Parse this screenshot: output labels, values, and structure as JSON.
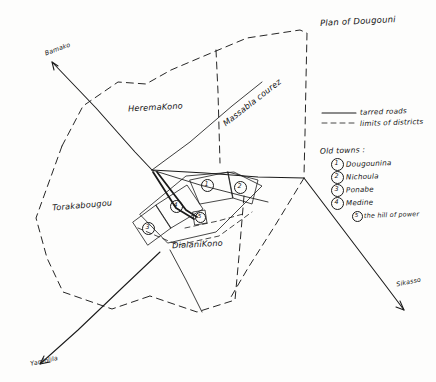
{
  "document": {
    "title": "Plan of Dougouni",
    "type": "hand-drawn map sketch",
    "background_color": "#fdfdfc",
    "ink_color": "#1a1a1a"
  },
  "districts": [
    {
      "id": "heremakono",
      "label": "HeremaKono",
      "x": 128,
      "y": 102,
      "rotate": -3
    },
    {
      "id": "massablacourez",
      "label": "Massabla courez",
      "x": 227,
      "y": 118,
      "rotate": -38
    },
    {
      "id": "torakabougou",
      "label": "Torakabougou",
      "x": 52,
      "y": 200,
      "rotate": -5
    },
    {
      "id": "dialanikono",
      "label": "DialaniKono",
      "x": 172,
      "y": 239,
      "rotate": -3
    }
  ],
  "road_arrows": [
    {
      "id": "bamako",
      "label": "Bamako",
      "x": 44,
      "y": 48,
      "rotate": -20
    },
    {
      "id": "yanfolila",
      "label": "Yanfolila",
      "x": 28,
      "y": 357,
      "rotate": -12
    },
    {
      "id": "sikasso",
      "label": "Sikasso",
      "x": 396,
      "y": 279,
      "rotate": -12
    }
  ],
  "legend": {
    "lines": [
      {
        "id": "tarred-roads",
        "label": "tarred roads",
        "style": "solid"
      },
      {
        "id": "district-limits",
        "label": "limits of districts",
        "style": "dashed"
      }
    ],
    "old_towns_heading": "Old towns :",
    "old_towns": [
      {
        "number": "1",
        "label": "Dougounina"
      },
      {
        "number": "2",
        "label": "Nichoula"
      },
      {
        "number": "3",
        "label": "Ponabe"
      },
      {
        "number": "4",
        "label": "Medine"
      }
    ],
    "extra": {
      "number": "5",
      "label": "the hill of power"
    }
  },
  "map_markers": [
    {
      "number": "1",
      "x": 206,
      "y": 184
    },
    {
      "number": "2",
      "x": 233,
      "y": 189
    },
    {
      "number": "3",
      "x": 146,
      "y": 227
    },
    {
      "number": "4",
      "x": 174,
      "y": 210
    },
    {
      "number": "5",
      "x": 199,
      "y": 219
    }
  ]
}
